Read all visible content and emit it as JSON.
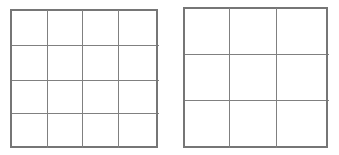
{
  "canvas": {
    "width": 339,
    "height": 155,
    "background_color": "#ffffff",
    "description": "Two blank rectangular grids drawn side by side on a white background"
  },
  "style": {
    "line_color": "#808080",
    "border_color": "#767676",
    "line_width": 1,
    "border_width": 1.2
  },
  "figures": [
    {
      "id": "grid-left",
      "name": "left-grid",
      "label": "4 by 4 grid",
      "rows": 4,
      "columns": 4,
      "cell_count": 16,
      "bounds": {
        "x": 11,
        "y": 10,
        "width": 146,
        "height": 137
      },
      "vertical_lines_x": [
        11,
        47,
        82,
        118,
        157
      ],
      "horizontal_lines_y": [
        10,
        45,
        80,
        113,
        147
      ]
    },
    {
      "id": "grid-right",
      "name": "right-grid",
      "label": "3 by 3 grid",
      "rows": 3,
      "columns": 3,
      "cell_count": 9,
      "bounds": {
        "x": 184,
        "y": 8,
        "width": 143,
        "height": 139
      },
      "vertical_lines_x": [
        184,
        229,
        276,
        327
      ],
      "horizontal_lines_y": [
        8,
        54,
        100,
        147
      ]
    }
  ]
}
